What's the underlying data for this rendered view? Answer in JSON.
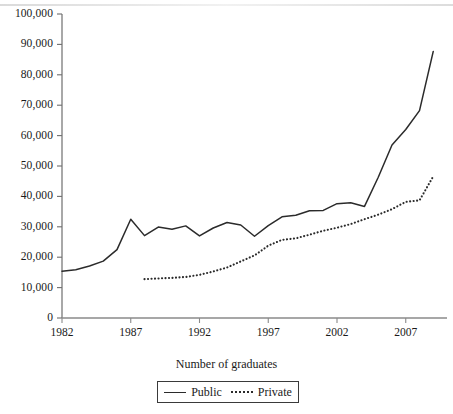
{
  "chart_data": {
    "type": "line",
    "title": "",
    "xlabel": "Number of graduates",
    "ylabel": "",
    "xlim": [
      1982,
      2010
    ],
    "ylim": [
      0,
      100000
    ],
    "grid": false,
    "legend_position": "bottom-center",
    "x_ticks": [
      1982,
      1987,
      1992,
      1997,
      2002,
      2007
    ],
    "y_ticks": [
      0,
      10000,
      20000,
      30000,
      40000,
      50000,
      60000,
      70000,
      80000,
      90000,
      100000
    ],
    "y_tick_labels": [
      "0",
      "10,000",
      "20,000",
      "30,000",
      "40,000",
      "50,000",
      "60,000",
      "70,000",
      "80,000",
      "90,000",
      "100,000"
    ],
    "x_tick_labels": [
      "1982",
      "1987",
      "1992",
      "1997",
      "2002",
      "2007"
    ],
    "series": [
      {
        "name": "Public",
        "style": "solid",
        "color": "#2b2b2b",
        "x": [
          1982,
          1983,
          1984,
          1985,
          1986,
          1987,
          1988,
          1989,
          1990,
          1991,
          1992,
          1993,
          1994,
          1995,
          1996,
          1997,
          1998,
          1999,
          2000,
          2001,
          2002,
          2003,
          2004,
          2005,
          2006,
          2007,
          2008,
          2009
        ],
        "values": [
          15400,
          15900,
          17100,
          18700,
          22500,
          32500,
          27100,
          29900,
          29200,
          30300,
          27000,
          29600,
          31400,
          30600,
          26900,
          30400,
          33300,
          33800,
          35300,
          35400,
          37600,
          37900,
          36700,
          46300,
          56900,
          62000,
          68200,
          87700
        ]
      },
      {
        "name": "Private",
        "style": "dotted",
        "color": "#2b2b2b",
        "x": [
          1988,
          1989,
          1990,
          1991,
          1992,
          1993,
          1994,
          1995,
          1996,
          1997,
          1998,
          1999,
          2000,
          2001,
          2002,
          2003,
          2004,
          2005,
          2006,
          2007,
          2008,
          2009
        ],
        "values": [
          12800,
          13000,
          13200,
          13500,
          14200,
          15300,
          16600,
          18600,
          20600,
          23800,
          25700,
          26200,
          27400,
          28700,
          29700,
          30900,
          32500,
          34000,
          35800,
          38200,
          38700,
          46600
        ]
      }
    ]
  },
  "legend": {
    "entries": [
      {
        "label": "Public"
      },
      {
        "label": "Private"
      }
    ]
  }
}
